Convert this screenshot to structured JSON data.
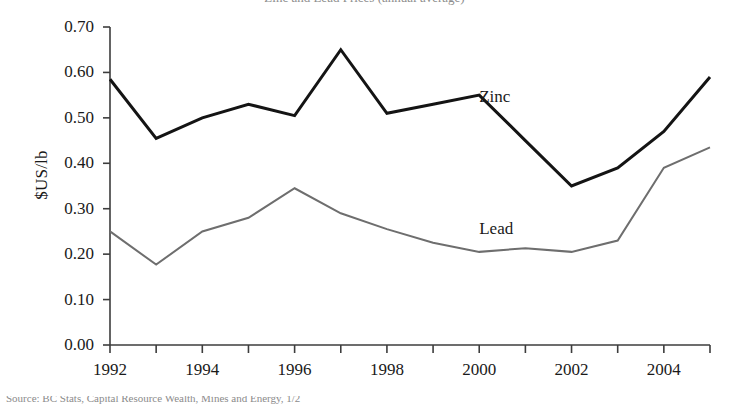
{
  "figure": {
    "clipped_title": "Zinc and Lead Prices (annual average)",
    "clipped_caption": "Source: BC Stats, Capital Resource Wealth, Mines and Energy, 1/2"
  },
  "chart_data": {
    "type": "line",
    "title": "Zinc and Lead Prices (annual average)",
    "xlabel": "",
    "ylabel": "$US/lb",
    "x": [
      1992,
      1993,
      1994,
      1995,
      1996,
      1997,
      1998,
      1999,
      2000,
      2001,
      2002,
      2003,
      2004,
      2005
    ],
    "xlim": [
      1992,
      2005
    ],
    "xtick_values": [
      1992,
      1993,
      1994,
      1995,
      1996,
      1997,
      1998,
      1999,
      2000,
      2001,
      2002,
      2003,
      2004,
      2005
    ],
    "xtick_labels": [
      "1992",
      "",
      "1994",
      "",
      "1996",
      "",
      "1998",
      "",
      "2000",
      "",
      "2002",
      "",
      "2004",
      ""
    ],
    "ylim": [
      0.0,
      0.7
    ],
    "ytick_values": [
      0.0,
      0.1,
      0.2,
      0.3,
      0.4,
      0.5,
      0.6,
      0.7
    ],
    "ytick_labels": [
      "0.00",
      "0.10",
      "0.20",
      "0.30",
      "0.40",
      "0.50",
      "0.60",
      "0.70"
    ],
    "grid": false,
    "legend": "inline-series-labels",
    "series": [
      {
        "name": "Zinc",
        "color": "#141414",
        "line_width": 3.0,
        "label_x": 2000.0,
        "label_y": 0.545,
        "values": [
          0.585,
          0.455,
          0.5,
          0.53,
          0.505,
          0.65,
          0.51,
          0.53,
          0.55,
          0.45,
          0.35,
          0.39,
          0.47,
          0.59
        ]
      },
      {
        "name": "Lead",
        "color": "#6e6e6e",
        "line_width": 2.0,
        "label_x": 2000.0,
        "label_y": 0.255,
        "values": [
          0.25,
          0.177,
          0.25,
          0.28,
          0.345,
          0.29,
          0.255,
          0.225,
          0.205,
          0.213,
          0.205,
          0.23,
          0.39,
          0.435
        ]
      }
    ]
  }
}
